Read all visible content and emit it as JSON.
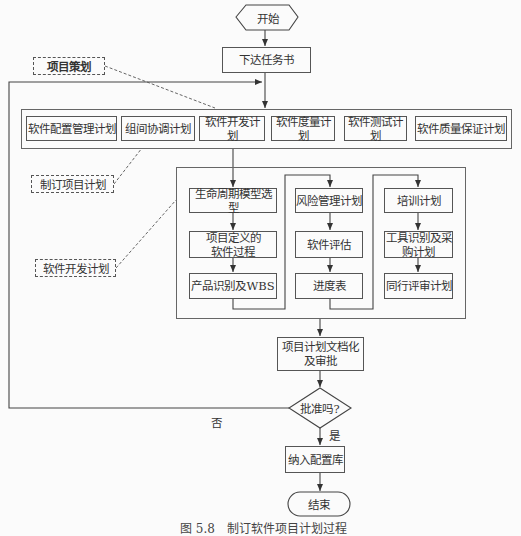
{
  "flowchart": {
    "start": "开始",
    "issue_task": "下达任务书",
    "plans_group": {
      "items": [
        "软件配置管理计划",
        "组间协调计划",
        "软件开发计划",
        "软件度量计划",
        "软件测试计划",
        "软件质量保证计划"
      ]
    },
    "dev_plan_group": {
      "column1": [
        "生命周期模型选型",
        "项目定义的\n软件过程",
        "产品识别及WBS"
      ],
      "column2": [
        "风险管理计划",
        "软件评估",
        "进度表"
      ],
      "column3": [
        "培训计划",
        "工具识别及采\n购计划",
        "同行评审计划"
      ]
    },
    "document_approve": "项目计划文档化\n及审批",
    "decision": "批准吗?",
    "yes_label": "是",
    "no_label": "否",
    "baseline": "纳入配置库",
    "end": "结束"
  },
  "annotations": {
    "project_planning": "项目策划",
    "make_project_plan": "制订项目计划",
    "software_dev_plan": "软件开发计划"
  },
  "caption": "图 5.8　制订软件项目计划过程"
}
